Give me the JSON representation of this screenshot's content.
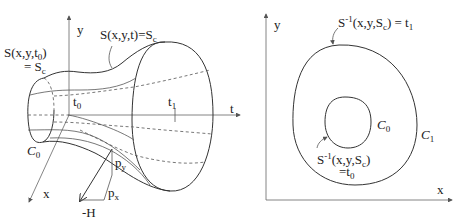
{
  "left_panel": {
    "axis_labels": {
      "y": "y",
      "t": "t",
      "x": "x"
    },
    "surface_label": "S(x,y,t)=S",
    "surface_label_sub": "c",
    "initial_label_line1": "S(x,y,t",
    "initial_label_line1_sub": "0",
    "initial_label_line1_end": ")",
    "initial_label_line2": "= S",
    "initial_label_line2_sub": "c",
    "t0_label": "t",
    "t0_sub": "0",
    "t1_label": "t",
    "t1_sub": "1",
    "c0_label": "C",
    "c0_sub": "0",
    "py_label": "p",
    "py_sub": "y",
    "px_label": "p",
    "px_sub": "x",
    "neg_h_label": "-H"
  },
  "right_panel": {
    "axis_labels": {
      "y": "y",
      "x": "x"
    },
    "outer_label": "S",
    "outer_label_sup": "-1",
    "outer_label_rest": "(x,y,S",
    "outer_label_sub": "c",
    "outer_label_end": ") = t",
    "outer_label_end_sub": "1",
    "inner_label_line1": "S",
    "inner_label_line1_sup": "-1",
    "inner_label_line1_rest": "(x,y,S",
    "inner_label_line1_sub": "c",
    "inner_label_line1_end": ")",
    "inner_label_line2": "=t",
    "inner_label_line2_sub": "0",
    "c0_label": "C",
    "c0_sub": "0",
    "c1_label": "C",
    "c1_sub": "1"
  }
}
